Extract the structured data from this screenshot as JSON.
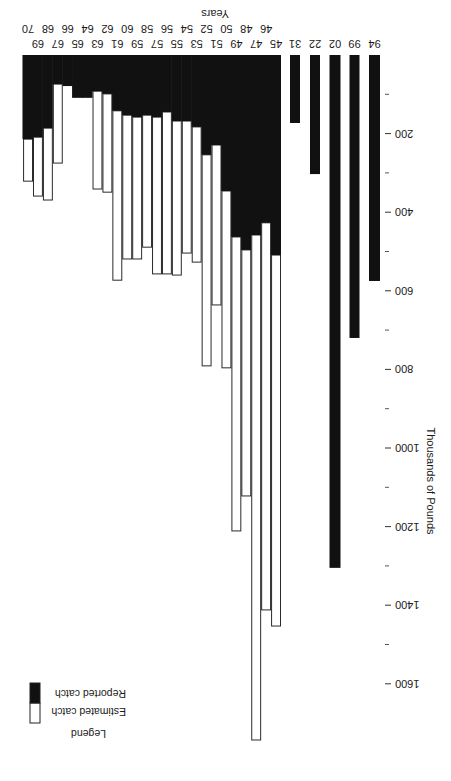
{
  "chart_data": {
    "type": "bar",
    "stacked": true,
    "title": "",
    "xlabel": "Years",
    "ylabel": "Thousands of Pounds",
    "ylim": [
      0,
      1750
    ],
    "yticks": [
      200,
      400,
      600,
      800,
      1000,
      1200,
      1400,
      1600
    ],
    "yminor_ticks": [
      100,
      300,
      500,
      700,
      900,
      1100,
      1300,
      1500
    ],
    "grid": false,
    "legend": {
      "title": "Legend",
      "position": "upper right",
      "entries": [
        {
          "label": "Estimated catch",
          "color": "#ffffff"
        },
        {
          "label": "Reported catch",
          "color": "#111111"
        }
      ]
    },
    "orientation_note": "image displayed rotated 180 degrees",
    "categories": [
      "1894",
      "1899",
      "1902",
      "1922",
      "1931",
      "1945",
      "1946",
      "1947",
      "1948",
      "1949",
      "1950",
      "1951",
      "1952",
      "1953",
      "1954",
      "1955",
      "1956",
      "1957",
      "1958",
      "1959",
      "1960",
      "1961",
      "1962",
      "1963",
      "1964",
      "1965",
      "1966",
      "1967",
      "1968",
      "1969",
      "1970"
    ],
    "tick_labels_row1": [
      "94",
      "99",
      "02",
      "22",
      "31",
      "45",
      "47",
      "49",
      "51",
      "53",
      "55",
      "57",
      "59",
      "61",
      "63",
      "65",
      "67",
      "69"
    ],
    "tick_labels_row2": [
      "46",
      "48",
      "50",
      "52",
      "54",
      "56",
      "58",
      "60",
      "62",
      "64",
      "66",
      "68",
      "70"
    ],
    "series": [
      {
        "name": "Reported catch",
        "color": "#111111",
        "values": [
          575,
          720,
          1305,
          303,
          173,
          509,
          427,
          458,
          496,
          463,
          346,
          229,
          254,
          183,
          168,
          168,
          145,
          158,
          153,
          158,
          153,
          142,
          99,
          92,
          109,
          109,
          79,
          74,
          186,
          209,
          214
        ]
      },
      {
        "name": "Estimated catch",
        "color": "#ffffff",
        "values": [
          0,
          0,
          0,
          0,
          0,
          944,
          985,
          1285,
          626,
          748,
          450,
          407,
          537,
          344,
          336,
          392,
          412,
          399,
          336,
          361,
          366,
          431,
          250,
          249,
          0,
          0,
          0,
          201,
          183,
          150,
          107
        ]
      }
    ],
    "totals": [
      575,
      720,
      1305,
      303,
      173,
      1453,
      1412,
      1743,
      1122,
      1211,
      796,
      636,
      791,
      527,
      504,
      560,
      557,
      557,
      489,
      519,
      519,
      573,
      349,
      341,
      109,
      109,
      79,
      275,
      369,
      359,
      321
    ]
  }
}
